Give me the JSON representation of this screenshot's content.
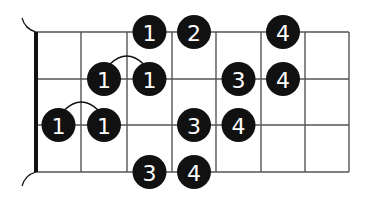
{
  "diagram": {
    "type": "fretboard-fingering",
    "strings": 4,
    "frets": 7,
    "colors": {
      "line": "#555555",
      "nut": "#111111",
      "dot": "#111111",
      "label": "#ffffff",
      "background": "#ffffff"
    },
    "geometry": {
      "nut_x": 36,
      "fret_x": [
        36,
        81,
        127,
        172,
        216,
        261,
        305,
        349
      ],
      "string_y": [
        32,
        79,
        125,
        172
      ],
      "dot_radius": 17
    },
    "dots": [
      {
        "string": 0,
        "fret": 3,
        "finger": "1"
      },
      {
        "string": 0,
        "fret": 4,
        "finger": "2"
      },
      {
        "string": 0,
        "fret": 6,
        "finger": "4"
      },
      {
        "string": 1,
        "fret": 2,
        "finger": "1"
      },
      {
        "string": 1,
        "fret": 3,
        "finger": "1"
      },
      {
        "string": 1,
        "fret": 5,
        "finger": "3"
      },
      {
        "string": 1,
        "fret": 6,
        "finger": "4"
      },
      {
        "string": 2,
        "fret": 1,
        "finger": "1"
      },
      {
        "string": 2,
        "fret": 2,
        "finger": "1"
      },
      {
        "string": 2,
        "fret": 4,
        "finger": "3"
      },
      {
        "string": 2,
        "fret": 5,
        "finger": "4"
      },
      {
        "string": 3,
        "fret": 3,
        "finger": "3"
      },
      {
        "string": 3,
        "fret": 4,
        "finger": "4"
      }
    ],
    "slurs": [
      {
        "string": 1,
        "from_fret": 2,
        "to_fret": 3
      },
      {
        "string": 2,
        "from_fret": 1,
        "to_fret": 2
      }
    ]
  }
}
